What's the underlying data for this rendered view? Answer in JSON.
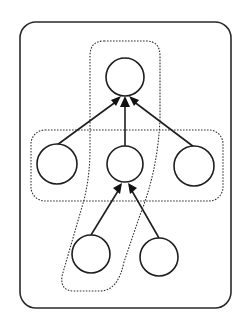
{
  "diagram": {
    "type": "tree",
    "colors": {
      "stroke": "#1e1e1e",
      "background": "#ffffff",
      "dashed": "#333333"
    },
    "outer_box": {
      "x": 20,
      "y": 22,
      "width": 211,
      "height": 286,
      "radius": 16
    },
    "groups": [
      {
        "id": "horizontal-group",
        "label": "",
        "style": "dotted"
      },
      {
        "id": "vertical-group",
        "label": "",
        "style": "dotted"
      }
    ],
    "nodes": [
      {
        "id": "root",
        "label": "",
        "cx": 125,
        "cy": 77,
        "r": 19
      },
      {
        "id": "mid-left",
        "label": "",
        "cx": 57,
        "cy": 164,
        "r": 20
      },
      {
        "id": "mid-center",
        "label": "",
        "cx": 125,
        "cy": 164,
        "r": 18
      },
      {
        "id": "mid-right",
        "label": "",
        "cx": 194,
        "cy": 166,
        "r": 20
      },
      {
        "id": "leaf-left",
        "label": "",
        "cx": 91,
        "cy": 254,
        "r": 19
      },
      {
        "id": "leaf-right",
        "label": "",
        "cx": 159,
        "cy": 257,
        "r": 19
      }
    ],
    "edges": [
      {
        "from": "mid-left",
        "to": "root"
      },
      {
        "from": "mid-center",
        "to": "root"
      },
      {
        "from": "mid-right",
        "to": "root"
      },
      {
        "from": "leaf-left",
        "to": "mid-center"
      },
      {
        "from": "leaf-right",
        "to": "mid-center"
      }
    ]
  }
}
